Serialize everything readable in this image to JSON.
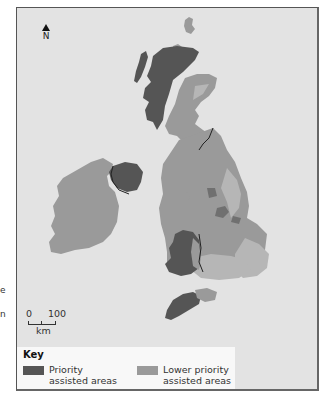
{
  "figure": {
    "edge_fragments": [
      "e",
      "n"
    ],
    "north_label": "N",
    "scale": {
      "start": "0",
      "end": "100",
      "unit": "km"
    },
    "legend": {
      "title": "Key",
      "items": [
        {
          "label": "Priority assisted areas",
          "color": "#555555"
        },
        {
          "label": "Lower priority assisted areas",
          "color": "#9a9a9a"
        }
      ]
    },
    "colors": {
      "sea": "#e3e3e3",
      "land": "#b6b6b6",
      "priority": "#555555",
      "lower_priority": "#9a9a9a",
      "border": "#222222"
    }
  }
}
